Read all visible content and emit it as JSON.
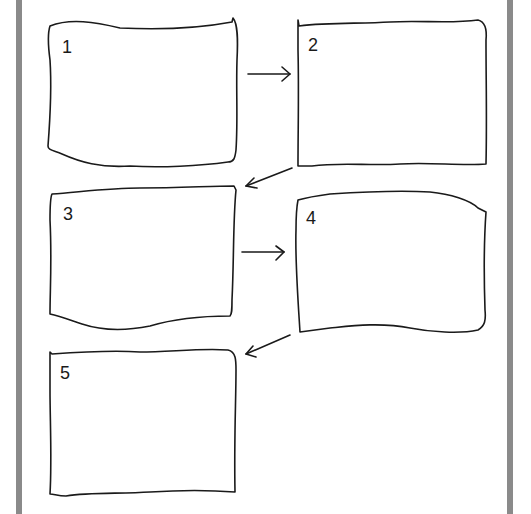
{
  "diagram": {
    "type": "storyboard-flow",
    "colors": {
      "stroke": "#1a1a1a",
      "side_bar": "#8a8a8a",
      "background": "#ffffff"
    },
    "frames": [
      {
        "id": "1",
        "label": "1",
        "x": 48,
        "y": 22,
        "w": 190,
        "h": 146
      },
      {
        "id": "2",
        "label": "2",
        "x": 298,
        "y": 20,
        "w": 188,
        "h": 146
      },
      {
        "id": "3",
        "label": "3",
        "x": 50,
        "y": 186,
        "w": 186,
        "h": 146
      },
      {
        "id": "4",
        "label": "4",
        "x": 296,
        "y": 192,
        "w": 190,
        "h": 142
      },
      {
        "id": "5",
        "label": "5",
        "x": 50,
        "y": 348,
        "w": 188,
        "h": 148
      }
    ],
    "arrows": [
      {
        "from": "1",
        "to": "2",
        "direction": "right"
      },
      {
        "from": "2",
        "to": "3",
        "direction": "down-left"
      },
      {
        "from": "3",
        "to": "4",
        "direction": "right"
      },
      {
        "from": "4",
        "to": "5",
        "direction": "down-left"
      }
    ]
  }
}
